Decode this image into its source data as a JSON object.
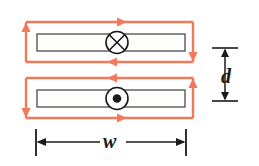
{
  "figure": {
    "type": "physics-diagram",
    "background_color": "#ffffff",
    "loop_color": "#f4795b",
    "conductor_outline_color": "#4a4a4a",
    "conductor_fill_color": "#fdfdfb",
    "symbol_color": "#1a1a1a",
    "dimension_color": "#1a1a1a"
  },
  "labels": {
    "separation": "d",
    "width": "w"
  },
  "conductors": [
    {
      "id": "upper-strip",
      "current_symbol": "cross",
      "current_symbol_meaning": "into-page",
      "loop_direction": "counterclockwise",
      "arrows": [
        {
          "edge": "top",
          "direction": "right"
        },
        {
          "edge": "right",
          "direction": "down"
        },
        {
          "edge": "bottom",
          "direction": "left"
        },
        {
          "edge": "left",
          "direction": "up"
        }
      ]
    },
    {
      "id": "lower-strip",
      "current_symbol": "dot",
      "current_symbol_meaning": "out-of-page",
      "loop_direction": "clockwise",
      "arrows": [
        {
          "edge": "top",
          "direction": "left"
        },
        {
          "edge": "left",
          "direction": "down"
        },
        {
          "edge": "bottom",
          "direction": "right"
        },
        {
          "edge": "right",
          "direction": "up"
        }
      ]
    }
  ],
  "dimensions": [
    {
      "name": "d",
      "orientation": "vertical",
      "label": "d"
    },
    {
      "name": "w",
      "orientation": "horizontal",
      "label": "w"
    }
  ]
}
